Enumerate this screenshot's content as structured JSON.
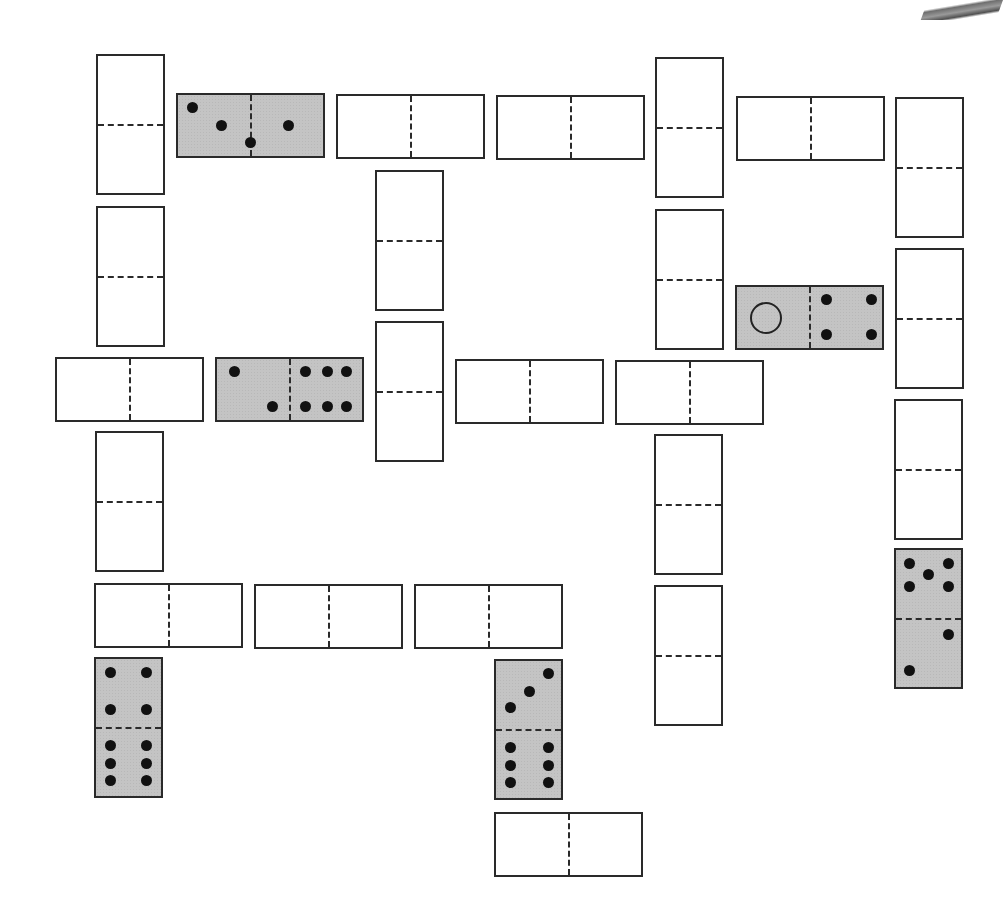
{
  "board": {
    "title": "Domino grid puzzle",
    "colors": {
      "tile_fill": "#ffffff",
      "filled_tile": "#c4c4c4",
      "outline": "#2a2a2a",
      "pip": "#111111"
    },
    "dominoes": [
      {
        "id": "d1",
        "orientation": "v",
        "x": 96,
        "y": 54,
        "filled": false,
        "pips": []
      },
      {
        "id": "d2",
        "orientation": "h",
        "x": 176,
        "y": 93,
        "filled": true,
        "pips": [
          [
            10,
            20
          ],
          [
            30,
            50
          ],
          [
            50,
            78
          ],
          [
            76,
            50
          ]
        ],
        "values": [
          3,
          1
        ]
      },
      {
        "id": "d3",
        "orientation": "h",
        "x": 336,
        "y": 94,
        "filled": false,
        "pips": []
      },
      {
        "id": "d4",
        "orientation": "h",
        "x": 496,
        "y": 95,
        "filled": false,
        "pips": []
      },
      {
        "id": "d5",
        "orientation": "v",
        "x": 655,
        "y": 57,
        "filled": false,
        "pips": []
      },
      {
        "id": "d6",
        "orientation": "h",
        "x": 736,
        "y": 96,
        "filled": false,
        "pips": []
      },
      {
        "id": "d7",
        "orientation": "v",
        "x": 895,
        "y": 97,
        "filled": false,
        "pips": []
      },
      {
        "id": "d8",
        "orientation": "v",
        "x": 96,
        "y": 206,
        "filled": false,
        "pips": []
      },
      {
        "id": "d9",
        "orientation": "v",
        "x": 375,
        "y": 170,
        "filled": false,
        "pips": []
      },
      {
        "id": "d10",
        "orientation": "v",
        "x": 655,
        "y": 209,
        "filled": false,
        "pips": []
      },
      {
        "id": "d11",
        "orientation": "h",
        "x": 735,
        "y": 285,
        "filled": true,
        "pips": [
          [
            20,
            50,
            "ring"
          ],
          [
            62,
            20
          ],
          [
            93,
            20
          ],
          [
            62,
            78
          ],
          [
            93,
            78
          ]
        ],
        "values": [
          "blank-circle",
          4
        ]
      },
      {
        "id": "d12",
        "orientation": "v",
        "x": 895,
        "y": 248,
        "filled": false,
        "pips": []
      },
      {
        "id": "d13",
        "orientation": "h",
        "x": 55,
        "y": 357,
        "filled": false,
        "pips": []
      },
      {
        "id": "d14",
        "orientation": "h",
        "x": 215,
        "y": 357,
        "filled": true,
        "pips": [
          [
            12,
            20
          ],
          [
            38,
            78
          ],
          [
            61,
            20
          ],
          [
            76,
            20
          ],
          [
            89,
            20
          ],
          [
            61,
            78
          ],
          [
            76,
            78
          ],
          [
            89,
            78
          ]
        ],
        "values": [
          2,
          6
        ]
      },
      {
        "id": "d15",
        "orientation": "v",
        "x": 375,
        "y": 321,
        "filled": false,
        "pips": []
      },
      {
        "id": "d16",
        "orientation": "h",
        "x": 455,
        "y": 359,
        "filled": false,
        "pips": []
      },
      {
        "id": "d17",
        "orientation": "h",
        "x": 615,
        "y": 360,
        "filled": false,
        "pips": []
      },
      {
        "id": "d18",
        "orientation": "v",
        "x": 894,
        "y": 399,
        "filled": false,
        "pips": []
      },
      {
        "id": "d19",
        "orientation": "v",
        "x": 95,
        "y": 431,
        "filled": false,
        "pips": []
      },
      {
        "id": "d20",
        "orientation": "v",
        "x": 654,
        "y": 434,
        "filled": false,
        "pips": []
      },
      {
        "id": "d21",
        "orientation": "v",
        "x": 894,
        "y": 548,
        "filled": true,
        "pips": [
          [
            20,
            10
          ],
          [
            80,
            10
          ],
          [
            50,
            18
          ],
          [
            20,
            27
          ],
          [
            80,
            27
          ],
          [
            80,
            62
          ],
          [
            20,
            88
          ]
        ],
        "values": [
          5,
          2
        ]
      },
      {
        "id": "d22",
        "orientation": "h",
        "x": 94,
        "y": 583,
        "filled": false,
        "pips": []
      },
      {
        "id": "d23",
        "orientation": "h",
        "x": 254,
        "y": 584,
        "filled": false,
        "pips": []
      },
      {
        "id": "d24",
        "orientation": "h",
        "x": 414,
        "y": 584,
        "filled": false,
        "pips": []
      },
      {
        "id": "d25",
        "orientation": "v",
        "x": 654,
        "y": 585,
        "filled": false,
        "pips": []
      },
      {
        "id": "d26",
        "orientation": "v",
        "x": 94,
        "y": 657,
        "filled": true,
        "pips": [
          [
            22,
            10
          ],
          [
            78,
            10
          ],
          [
            22,
            37
          ],
          [
            78,
            37
          ],
          [
            22,
            63
          ],
          [
            78,
            63
          ],
          [
            22,
            76
          ],
          [
            78,
            76
          ],
          [
            22,
            89
          ],
          [
            78,
            89
          ]
        ],
        "values": [
          4,
          6
        ]
      },
      {
        "id": "d27",
        "orientation": "v",
        "x": 494,
        "y": 659,
        "filled": true,
        "pips": [
          [
            80,
            9
          ],
          [
            52,
            22
          ],
          [
            22,
            34
          ],
          [
            22,
            63
          ],
          [
            80,
            63
          ],
          [
            22,
            76
          ],
          [
            80,
            76
          ],
          [
            22,
            89
          ],
          [
            80,
            89
          ]
        ],
        "values": [
          3,
          6
        ]
      },
      {
        "id": "d28",
        "orientation": "h",
        "x": 494,
        "y": 812,
        "filled": false,
        "pips": []
      }
    ]
  }
}
